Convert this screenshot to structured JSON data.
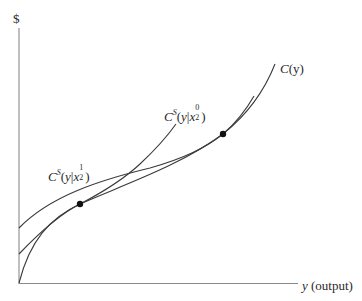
{
  "diagram": {
    "title": "",
    "axes": {
      "y_label": "$",
      "x_label_var": "y",
      "x_label_text": "(output)"
    },
    "curves": [
      {
        "id": "long-run-cost",
        "label_main": "C",
        "label_arg": "(y)",
        "description": "Long-run cost curve starting at origin"
      },
      {
        "id": "short-run-cost-x2-0",
        "label_main": "C",
        "label_sup": "S",
        "label_open": "(",
        "label_var": "y",
        "label_bar": "|",
        "label_x": "x",
        "label_sub": "2",
        "label_supidx": "0",
        "label_close": ")",
        "description": "Short-run cost curve tangent to C(y) at lower output point"
      },
      {
        "id": "short-run-cost-x2-1",
        "label_main": "C",
        "label_sup": "S",
        "label_open": "(",
        "label_var": "y",
        "label_bar": "|",
        "label_x": "x",
        "label_sub": "2",
        "label_supidx": "1",
        "label_close": ")",
        "description": "Short-run cost curve tangent to C(y) at higher output point"
      }
    ],
    "tangency_points": [
      {
        "id": "tangency-low",
        "curve": "short-run-cost-x2-0"
      },
      {
        "id": "tangency-high",
        "curve": "short-run-cost-x2-1"
      }
    ],
    "colors": {
      "axis": "#8a8a8a",
      "curve": "#3a3a3a",
      "dot": "#111111",
      "text": "#2a2a2a"
    }
  }
}
